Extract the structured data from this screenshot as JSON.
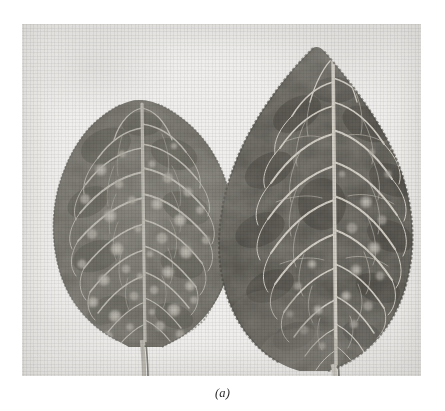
{
  "figure": {
    "caption": "(a)",
    "alt_description": "Two detached plant leaves photographed side by side on a pale background; the smaller left leaf shows numerous pale circular lesion spots, the larger right leaf is darker with prominent pale veins and a serrated margin.",
    "background_color": "#ffffff",
    "plate_color": "#f2f1ef",
    "plate": {
      "x": 22,
      "y": 24,
      "width": 399,
      "height": 352
    }
  },
  "subjects": [
    {
      "id": "leaf-left",
      "label": "left leaf",
      "position": "left",
      "relative_size": "smaller",
      "tone": "#6f6d68",
      "vein_tone": "#d8d6d0",
      "tip_point": {
        "x": 120,
        "y": 103
      },
      "base_point": {
        "x": 124,
        "y": 345
      },
      "margin": "entire to finely crenate",
      "lesion_count_visible": 46,
      "lesion_tone": "#b9b6ae",
      "notes": "heavily spotted with pale circular lesions"
    },
    {
      "id": "leaf-right",
      "label": "right leaf",
      "position": "right",
      "relative_size": "larger",
      "tone": "#5a584f",
      "vein_tone": "#ddd9d0",
      "tip_point": {
        "x": 313,
        "y": 46
      },
      "base_point": {
        "x": 315,
        "y": 360
      },
      "margin": "serrate / dentate",
      "lesion_count_visible": 18,
      "lesion_tone": "#9d9a92",
      "notes": "darker lamina, strongly reticulate venation, toothed margin"
    }
  ],
  "colors": {
    "paper": "#f2f1ef",
    "leaf_dark": "#55534b",
    "leaf_mid": "#6f6d66",
    "leaf_light": "#8b8981",
    "vein": "#ddd9d2",
    "lesion": "#b5b2aa",
    "caption_text": "#2a2a2a"
  }
}
